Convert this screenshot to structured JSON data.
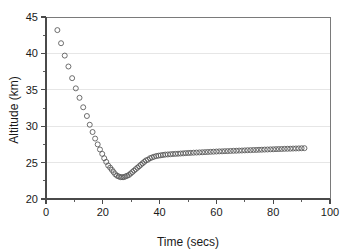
{
  "chart_data": {
    "type": "scatter",
    "title": "",
    "xlabel": "Time (secs)",
    "ylabel": "Altitude (km)",
    "xlim": [
      0,
      100
    ],
    "ylim": [
      20,
      45
    ],
    "xticks": [
      0,
      20,
      40,
      60,
      80,
      100
    ],
    "yticks": [
      20,
      25,
      30,
      35,
      40,
      45
    ],
    "xtick_labels": [
      "0",
      "20",
      "40",
      "60",
      "80",
      "100"
    ],
    "ytick_labels": [
      "20",
      "25",
      "30",
      "35",
      "40",
      "45"
    ],
    "x_minor_tick_interval": 10,
    "y_minor_tick_interval": 2.5,
    "grid": "horizontal-major",
    "legend": "none",
    "marker_style": "open-circle",
    "marker_color": "#555555",
    "series": [
      {
        "name": "Altitude",
        "x": [
          4.0,
          5.3,
          6.6,
          7.9,
          9.2,
          10.5,
          11.8,
          13.1,
          14.4,
          15.4,
          16.4,
          17.3,
          18.2,
          19.0,
          19.8,
          20.5,
          21.2,
          21.9,
          22.6,
          23.2,
          23.8,
          24.4,
          25.0,
          25.6,
          26.2,
          26.8,
          27.4,
          28.0,
          28.6,
          29.2,
          29.8,
          30.4,
          31.0,
          31.6,
          32.2,
          32.8,
          33.4,
          34.0,
          34.6,
          35.2,
          35.9,
          36.6,
          37.3,
          38.0,
          38.8,
          39.6,
          40.4,
          41.2,
          42.0,
          42.9,
          43.8,
          44.7,
          45.6,
          46.5,
          47.4,
          48.3,
          49.2,
          50.1,
          51.0,
          52.0,
          53.0,
          54.0,
          55.0,
          56.0,
          57.0,
          58.0,
          59.0,
          60.0,
          61.0,
          62.0,
          63.0,
          64.0,
          65.0,
          66.0,
          67.0,
          68.0,
          69.0,
          70.0,
          71.0,
          72.0,
          73.0,
          74.0,
          75.0,
          76.0,
          77.0,
          78.0,
          79.0,
          80.0,
          81.0,
          82.0,
          83.0,
          84.0,
          85.0,
          86.0,
          87.0,
          88.0,
          89.0,
          90.0,
          91.0
        ],
        "y": [
          43.2,
          41.4,
          39.7,
          38.2,
          36.6,
          35.2,
          33.9,
          32.6,
          31.4,
          30.2,
          29.2,
          28.3,
          27.5,
          26.8,
          26.2,
          25.6,
          25.1,
          24.6,
          24.3,
          24.0,
          23.7,
          23.4,
          23.2,
          23.1,
          23.0,
          23.0,
          23.0,
          23.1,
          23.2,
          23.3,
          23.5,
          23.7,
          23.9,
          24.1,
          24.3,
          24.5,
          24.7,
          24.9,
          25.1,
          25.3,
          25.4,
          25.6,
          25.7,
          25.8,
          25.9,
          25.95,
          26.0,
          26.05,
          26.1,
          26.12,
          26.15,
          26.18,
          26.2,
          26.22,
          26.25,
          26.27,
          26.3,
          26.32,
          26.34,
          26.36,
          26.38,
          26.4,
          26.42,
          26.44,
          26.46,
          26.48,
          26.5,
          26.52,
          26.54,
          26.55,
          26.57,
          26.58,
          26.6,
          26.62,
          26.63,
          26.65,
          26.66,
          26.68,
          26.7,
          26.71,
          26.73,
          26.74,
          26.76,
          26.77,
          26.79,
          26.8,
          26.82,
          26.83,
          26.85,
          26.86,
          26.87,
          26.89,
          26.9,
          26.91,
          26.93,
          26.94,
          26.95,
          26.97,
          26.98
        ]
      }
    ]
  }
}
